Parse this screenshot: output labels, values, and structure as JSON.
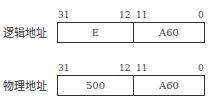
{
  "rows": [
    {
      "label": "逻辑地址",
      "bits": {
        "hi_start": "31",
        "hi_end": "12",
        "lo_start": "11",
        "lo_end": "0"
      },
      "fields": {
        "high": "E",
        "low": "A60"
      }
    },
    {
      "label": "物理地址",
      "bits": {
        "hi_start": "31",
        "hi_end": "12",
        "lo_start": "11",
        "lo_end": "0"
      },
      "fields": {
        "high": "500",
        "low": "A60"
      }
    }
  ]
}
